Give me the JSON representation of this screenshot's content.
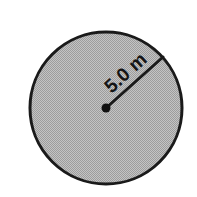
{
  "figure": {
    "name": "circle-with-radius-diagram",
    "shape": "circle",
    "background_color": "#ffffff"
  },
  "circle": {
    "center_x": 106,
    "center_y": 108,
    "radius_px": 76,
    "fill_color": "#b3b3b3",
    "stroke_color": "#1a1a1a",
    "stroke_width_px": 3,
    "fill_pattern": "halftone-dither"
  },
  "radius": {
    "label": "5.0 m",
    "value": 5.0,
    "unit": "m",
    "label_rotation_deg": -42,
    "line_color": "#1a1a1a",
    "line_width_px": 3,
    "start_x": 106,
    "start_y": 108,
    "end_x": 163,
    "end_y": 57,
    "center_dot_radius_px": 4.5,
    "center_dot_color": "#111111"
  }
}
